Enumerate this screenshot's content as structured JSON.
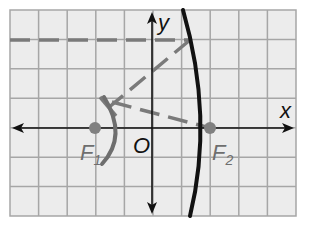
{
  "diagram": {
    "type": "hyperbola-reflection",
    "colors": {
      "background": "#ffffff",
      "grid_fill": "#ececec",
      "grid_line": "#a6a6a6",
      "axis": "#111111",
      "curve_main": "#111111",
      "curve_secondary": "#6e6e6e",
      "dashed": "#7a7a7a",
      "focus_point": "#808080",
      "label_dark": "#111111",
      "label_gray": "#6e6e6e"
    },
    "grid": {
      "left": 10,
      "right": 296,
      "top": 10,
      "bottom": 216,
      "cols": 10,
      "rows": 7
    },
    "axes": {
      "origin_px": [
        152,
        128
      ],
      "x_label": "x",
      "y_label": "y",
      "origin_label": "O"
    },
    "foci": [
      {
        "id": "F1",
        "label": "F",
        "subscript": "1",
        "px": [
          95,
          128
        ]
      },
      {
        "id": "F2",
        "label": "F",
        "subscript": "2",
        "px": [
          210,
          128
        ]
      }
    ],
    "curves": {
      "right_branch": "M 183 10 Q 214 118 190 216",
      "left_branch": "M 104 97 Q 128 136 102 164"
    },
    "dashed_lines": [
      {
        "name": "incoming-ray",
        "from": [
          10,
          40
        ],
        "to": [
          190,
          40
        ]
      },
      {
        "name": "reflected-ray-to-left",
        "from": [
          190,
          40
        ],
        "to": [
          108,
          108
        ]
      },
      {
        "name": "ray-to-f2",
        "from": [
          112,
          102
        ],
        "to": [
          210,
          128
        ]
      }
    ],
    "tick_mark": {
      "from": [
        100,
        97
      ],
      "to": [
        116,
        116
      ]
    }
  }
}
